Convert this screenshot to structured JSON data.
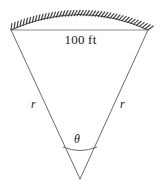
{
  "figure": {
    "type": "geometry-diagram",
    "background_color": "#ffffff",
    "stroke_color": "#6b6b6b",
    "hatch_color": "#4a4a4a",
    "chord_color": "#8c8c8c",
    "text_color": "#1a1a1a",
    "labels": {
      "chord": "100 ft",
      "radius_left": "r",
      "radius_right": "r",
      "angle": "θ"
    },
    "geometry": {
      "apex": [
        80,
        179
      ],
      "chord_left": [
        11,
        30
      ],
      "chord_right": [
        148,
        30
      ],
      "arc_peak": [
        80,
        16
      ],
      "angle_arc_radius": 36,
      "hatch_count": 46,
      "hatch_length": 7
    }
  }
}
